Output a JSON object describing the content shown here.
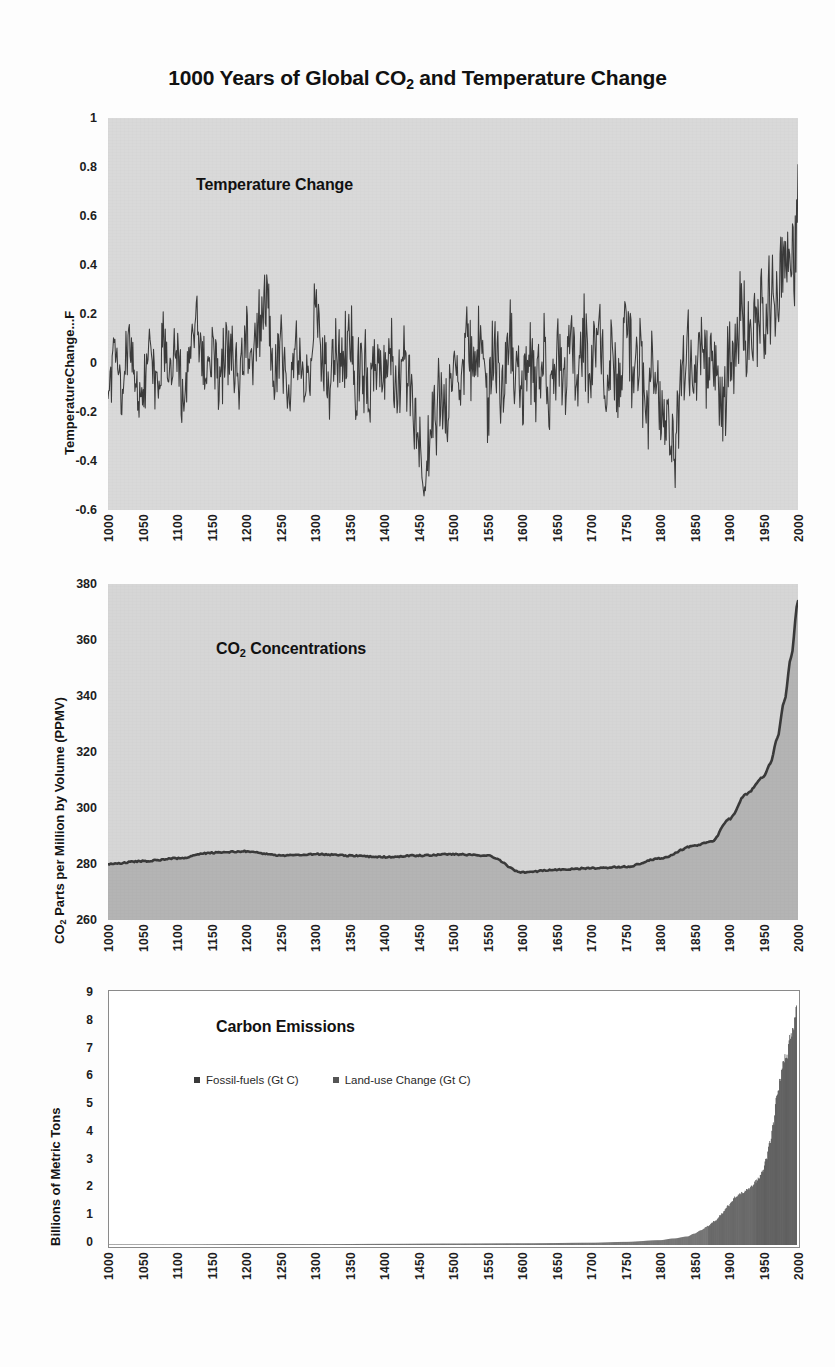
{
  "title": {
    "prefix": "1000 Years of Global CO",
    "sub": "2",
    "suffix": " and Temperature Change"
  },
  "panels": {
    "temperature": {
      "annotation": "Temperature Change",
      "y_title": "TemperatureChange...F",
      "y_ticks": [
        "1",
        "0.8",
        "0.6",
        "0.4",
        "0.2",
        "0",
        "-0.2",
        "-0.4",
        "-0.6"
      ]
    },
    "co2": {
      "annotation_prefix": "CO",
      "annotation_sub": "2",
      "annotation_suffix": " Concentrations",
      "y_title_prefix": "CO",
      "y_title_sub": "2",
      "y_title_suffix": " Parts per Million by Volume (PPMV)",
      "y_ticks": [
        "380",
        "360",
        "340",
        "320",
        "300",
        "280",
        "260"
      ]
    },
    "emissions": {
      "annotation": "Carbon Emissions",
      "y_title": "Billions of Metric Tons",
      "y_ticks": [
        "9",
        "8",
        "7",
        "6",
        "5",
        "4",
        "3",
        "2",
        "1",
        "0"
      ],
      "legend": [
        {
          "label": "Fossil-fuels (Gt C)",
          "color": "#3a3a3a"
        },
        {
          "label": "Land-use Change (Gt C)",
          "color": "#555555"
        }
      ]
    }
  },
  "x_ticks": [
    "1000",
    "1050",
    "1100",
    "1150",
    "1200",
    "1250",
    "1300",
    "1350",
    "1400",
    "1450",
    "1500",
    "1550",
    "1600",
    "1650",
    "1700",
    "1750",
    "1800",
    "1850",
    "1900",
    "1950",
    "2000"
  ],
  "colors": {
    "plot_background_temp": "#d9d9d9",
    "plot_background_co2": "#d6d6d6",
    "plot_background_emissions": "#ffffff",
    "series_line": "#3b3b3b",
    "co2_fill": "#b4b4b4",
    "emissions_fill": "#3a3a3a",
    "text": "#1a1a1a"
  },
  "chart_data": [
    {
      "type": "line",
      "id": "temperature-change",
      "title": "Temperature Change",
      "xlabel": "",
      "ylabel": "TemperatureChange...F",
      "xlim": [
        1000,
        2000
      ],
      "ylim": [
        -0.6,
        1
      ],
      "grid": false,
      "x_tick_step": 50,
      "y_tick_step": 0.2,
      "units": "degrees Fahrenheit anomaly",
      "description": "High-frequency annual temperature anomaly series oscillating near 0 from 1000-1900, dipping to about -0.45 near 1460, then rising sharply after 1900 to a peak near +0.86 at 2000.",
      "x": [
        1000,
        1010,
        1020,
        1030,
        1040,
        1050,
        1060,
        1070,
        1080,
        1090,
        1100,
        1110,
        1120,
        1130,
        1140,
        1150,
        1160,
        1170,
        1180,
        1190,
        1200,
        1210,
        1220,
        1230,
        1240,
        1250,
        1260,
        1270,
        1280,
        1290,
        1300,
        1310,
        1320,
        1330,
        1340,
        1350,
        1360,
        1370,
        1380,
        1390,
        1400,
        1410,
        1420,
        1430,
        1440,
        1450,
        1460,
        1470,
        1480,
        1490,
        1500,
        1510,
        1520,
        1530,
        1540,
        1550,
        1560,
        1570,
        1580,
        1590,
        1600,
        1610,
        1620,
        1630,
        1640,
        1650,
        1660,
        1670,
        1680,
        1690,
        1700,
        1710,
        1720,
        1730,
        1740,
        1750,
        1760,
        1770,
        1780,
        1790,
        1800,
        1810,
        1820,
        1830,
        1840,
        1850,
        1860,
        1870,
        1880,
        1890,
        1900,
        1910,
        1920,
        1930,
        1940,
        1950,
        1960,
        1970,
        1980,
        1990,
        2000
      ],
      "values": [
        -0.06,
        0.05,
        -0.1,
        0.12,
        -0.02,
        -0.12,
        0.03,
        -0.08,
        0.09,
        -0.05,
        0.01,
        -0.14,
        0.08,
        0.15,
        -0.04,
        0.06,
        -0.11,
        0.1,
        0.02,
        -0.09,
        0.13,
        -0.03,
        0.18,
        0.27,
        -0.06,
        0.05,
        -0.13,
        0.11,
        0.0,
        -0.1,
        0.17,
        0.04,
        -0.15,
        0.08,
        -0.02,
        0.12,
        -0.07,
        0.01,
        -0.18,
        0.06,
        -0.05,
        0.09,
        -0.12,
        0.03,
        -0.22,
        -0.3,
        -0.45,
        -0.26,
        -0.14,
        -0.2,
        0.02,
        -0.08,
        0.1,
        -0.05,
        0.07,
        -0.16,
        0.04,
        -0.12,
        0.12,
        -0.03,
        -0.14,
        0.05,
        -0.09,
        0.08,
        -0.18,
        0.02,
        -0.1,
        0.14,
        -0.06,
        0.1,
        -0.02,
        0.16,
        -0.08,
        0.06,
        -0.13,
        0.18,
        -0.04,
        0.09,
        -0.2,
        0.03,
        -0.12,
        -0.28,
        -0.36,
        -0.15,
        0.05,
        -0.08,
        0.14,
        -0.06,
        0.02,
        -0.16,
        -0.04,
        0.1,
        0.18,
        0.06,
        0.22,
        0.14,
        0.3,
        0.26,
        0.42,
        0.38,
        0.55,
        0.86
      ]
    },
    {
      "type": "area",
      "id": "co2-concentrations",
      "title": "CO2 Concentrations",
      "xlabel": "",
      "ylabel": "CO2 Parts per Million by Volume (PPMV)",
      "xlim": [
        1000,
        2000
      ],
      "ylim": [
        260,
        380
      ],
      "grid": false,
      "x_tick_step": 50,
      "y_tick_step": 20,
      "units": "PPMV",
      "description": "CO2 stays near 280 ppmv from 1000-1800 with a small bump near 1200 (about 285) and a dip near 1600 (about 277), then rises steeply after 1850 to about 374 ppmv in 2000.",
      "x": [
        1000,
        1050,
        1100,
        1150,
        1200,
        1250,
        1300,
        1350,
        1400,
        1450,
        1500,
        1550,
        1600,
        1650,
        1700,
        1750,
        1800,
        1850,
        1875,
        1900,
        1925,
        1950,
        1960,
        1970,
        1980,
        1990,
        2000
      ],
      "values": [
        280.0,
        281.0,
        282.0,
        284.0,
        284.5,
        283.0,
        283.5,
        283.0,
        282.5,
        283.0,
        283.5,
        283.0,
        277.0,
        278.0,
        278.5,
        279.0,
        282.0,
        286.5,
        288.0,
        296.0,
        305.0,
        311.0,
        316.0,
        325.0,
        338.0,
        354.0,
        374.0
      ]
    },
    {
      "type": "bar",
      "id": "carbon-emissions",
      "title": "Carbon Emissions",
      "xlabel": "",
      "ylabel": "Billions of Metric Tons",
      "xlim": [
        1000,
        2000
      ],
      "ylim": [
        0,
        9
      ],
      "grid": false,
      "x_tick_step": 50,
      "y_tick_step": 1,
      "units": "Gt C",
      "legend_position": "inside-top-left",
      "series": [
        {
          "name": "Fossil-fuels (Gt C)",
          "x": [
            1000,
            1100,
            1200,
            1300,
            1400,
            1500,
            1600,
            1700,
            1750,
            1800,
            1820,
            1840,
            1850,
            1860,
            1870,
            1880,
            1890,
            1900,
            1910,
            1920,
            1930,
            1940,
            1950,
            1955,
            1960,
            1965,
            1970,
            1975,
            1980,
            1985,
            1990,
            1995,
            1999,
            2000
          ],
          "values": [
            0.0,
            0.0,
            0.0,
            0.0,
            0.0,
            0.0,
            0.0,
            0.0,
            0.01,
            0.03,
            0.05,
            0.08,
            0.12,
            0.18,
            0.25,
            0.35,
            0.5,
            0.7,
            0.9,
            1.0,
            1.1,
            1.3,
            1.6,
            2.0,
            2.5,
            3.1,
            4.0,
            4.6,
            5.3,
            5.4,
            6.1,
            6.4,
            7.0,
            6.6
          ]
        },
        {
          "name": "Land-use Change (Gt C)",
          "x": [
            1000,
            1100,
            1200,
            1300,
            1400,
            1500,
            1600,
            1700,
            1750,
            1800,
            1820,
            1840,
            1850,
            1860,
            1870,
            1880,
            1890,
            1900,
            1910,
            1920,
            1930,
            1940,
            1950,
            1955,
            1960,
            1965,
            1970,
            1975,
            1980,
            1985,
            1990,
            1995,
            1999,
            2000
          ],
          "values": [
            0.02,
            0.02,
            0.03,
            0.03,
            0.04,
            0.05,
            0.06,
            0.08,
            0.1,
            0.14,
            0.18,
            0.22,
            0.28,
            0.34,
            0.42,
            0.5,
            0.6,
            0.7,
            0.8,
            0.85,
            0.9,
            0.95,
            1.0,
            1.05,
            1.1,
            1.15,
            1.2,
            1.25,
            1.3,
            1.3,
            1.35,
            1.35,
            1.4,
            1.4
          ]
        }
      ]
    }
  ]
}
